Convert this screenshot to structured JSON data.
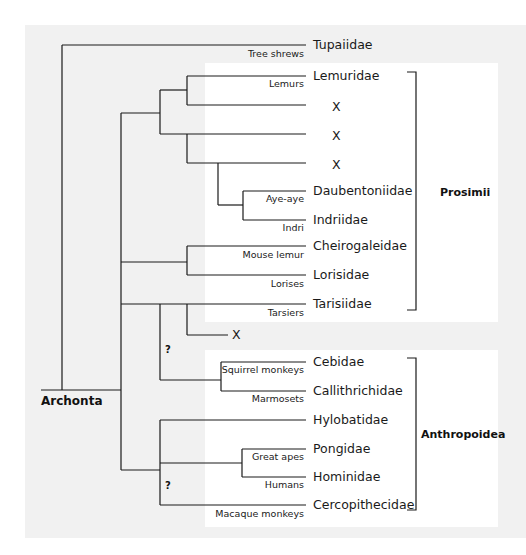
{
  "diagram": {
    "type": "phylogenetic-tree",
    "root_label": "Archonta",
    "groups": [
      {
        "name": "Prosimii"
      },
      {
        "name": "Anthropoidea"
      }
    ],
    "uncertain_marker": "?",
    "tips": [
      {
        "taxon": "Tupaiidae",
        "common": "Tree shrews"
      },
      {
        "taxon": "Lemuridae",
        "common": "Lemurs"
      },
      {
        "taxon": "X",
        "common": ""
      },
      {
        "taxon": "X",
        "common": ""
      },
      {
        "taxon": "X",
        "common": ""
      },
      {
        "taxon": "Daubentoniidae",
        "common": "Aye-aye"
      },
      {
        "taxon": "Indriidae",
        "common": "Indri"
      },
      {
        "taxon": "Cheirogaleidae",
        "common": "Mouse lemur"
      },
      {
        "taxon": "Lorisidae",
        "common": "Lorises"
      },
      {
        "taxon": "Tarisiidae",
        "common": "Tarsiers"
      },
      {
        "taxon": "X",
        "common": ""
      },
      {
        "taxon": "Cebidae",
        "common": "Squirrel monkeys"
      },
      {
        "taxon": "Callithrichidae",
        "common": "Marmosets"
      },
      {
        "taxon": "Hylobatidae",
        "common": ""
      },
      {
        "taxon": "Pongidae",
        "common": "Great apes"
      },
      {
        "taxon": "Hominidae",
        "common": "Humans"
      },
      {
        "taxon": "Cercopithecidae",
        "common": "Macaque monkeys"
      }
    ]
  }
}
